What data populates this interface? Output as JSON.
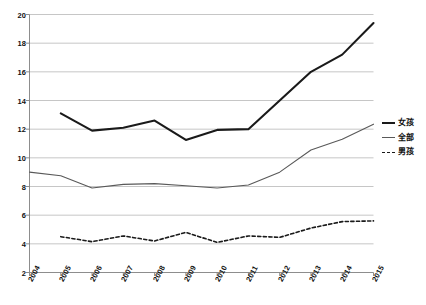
{
  "chart_data": {
    "type": "line",
    "title": "",
    "xlabel": "",
    "ylabel": "",
    "categories": [
      "2004",
      "2005",
      "2006",
      "2007",
      "2008",
      "2009",
      "2010",
      "2011",
      "2012",
      "2013",
      "2014",
      "2015"
    ],
    "ylim": [
      2,
      20
    ],
    "ytick_step": 2,
    "yticks": [
      "2",
      "4",
      "6",
      "8",
      "10",
      "12",
      "14",
      "16",
      "18",
      "20"
    ],
    "grid": "horizontal",
    "legend_position": "right",
    "series": [
      {
        "name": "女孩",
        "style": "solid-thick",
        "color": "#1a1a1a",
        "values": [
          null,
          13.1,
          11.9,
          12.1,
          12.6,
          11.25,
          11.95,
          12.0,
          14.0,
          16.0,
          17.2,
          19.4
        ]
      },
      {
        "name": "全部",
        "style": "solid-thin",
        "color": "#595959",
        "values": [
          9.0,
          8.75,
          7.9,
          8.15,
          8.2,
          8.05,
          7.9,
          8.1,
          9.0,
          10.55,
          11.3,
          12.35
        ]
      },
      {
        "name": "男孩",
        "style": "dashed",
        "color": "#1a1a1a",
        "values": [
          null,
          4.5,
          4.15,
          4.55,
          4.2,
          4.8,
          4.1,
          4.55,
          4.45,
          5.1,
          5.55,
          5.6
        ]
      }
    ]
  },
  "legend": {
    "items": [
      {
        "label": "女孩"
      },
      {
        "label": "全部"
      },
      {
        "label": "男孩"
      }
    ]
  },
  "axes": {
    "y_ticks": [
      "20",
      "18",
      "16",
      "14",
      "12",
      "10",
      "8",
      "6",
      "4",
      "2"
    ],
    "x_ticks": [
      "2004",
      "2005",
      "2006",
      "2007",
      "2008",
      "2009",
      "2010",
      "2011",
      "2012",
      "2013",
      "2014",
      "2015"
    ]
  },
  "colors": {
    "series_girls": "#1a1a1a",
    "series_total": "#595959",
    "series_boys": "#1a1a1a",
    "grid": "#b8b8b8",
    "axis": "#808080",
    "background": "#ffffff"
  }
}
